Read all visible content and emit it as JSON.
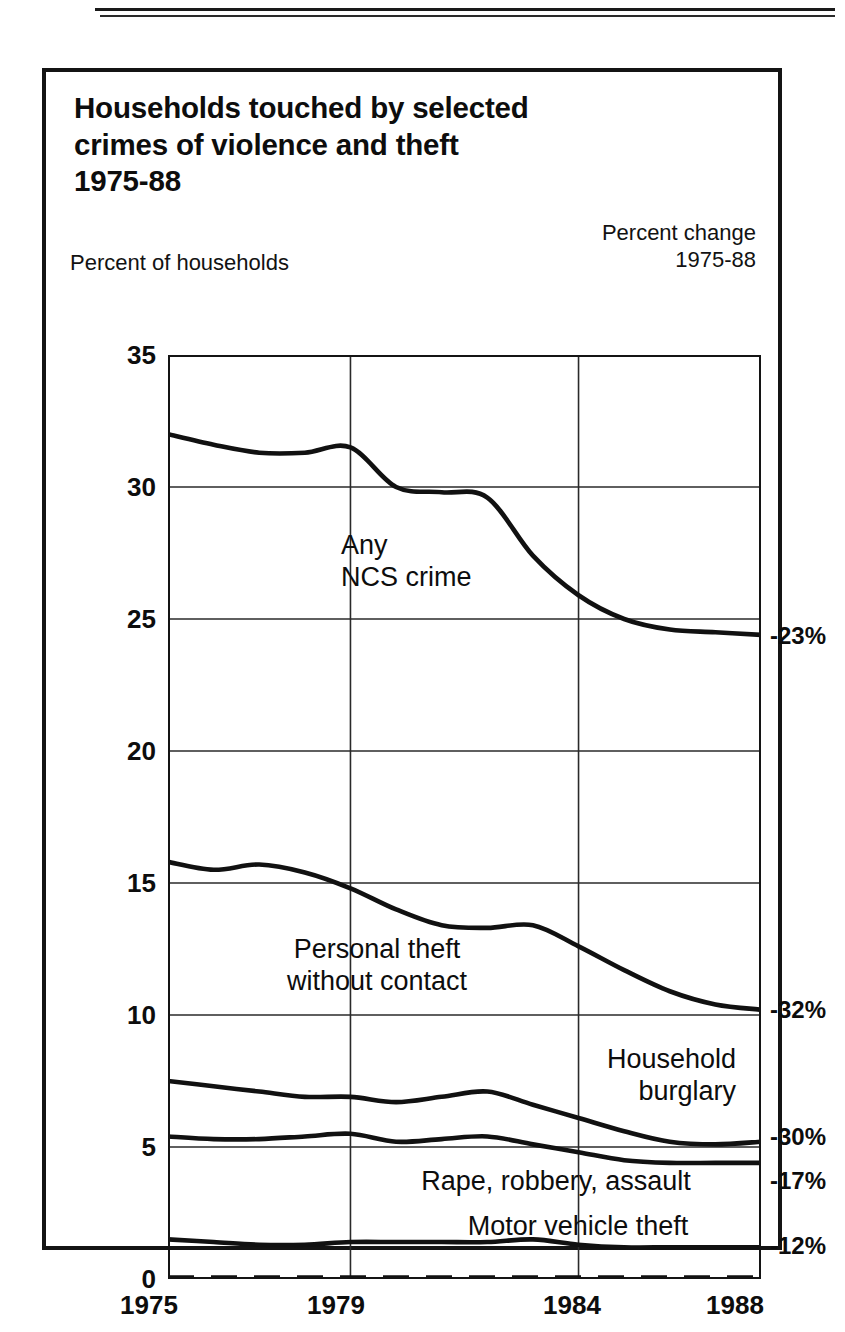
{
  "figure": {
    "title": "Households touched by selected\ncrimes of violence and theft\n1975-88",
    "y_axis_caption": "Percent of households",
    "right_caption": "Percent change\n1975-88"
  },
  "chart_data": {
    "type": "line",
    "title": "Households touched by selected crimes of violence and theft 1975-88",
    "xlabel": "",
    "ylabel": "Percent of households",
    "xlim": [
      1975,
      1988
    ],
    "ylim": [
      0,
      35
    ],
    "yticks": [
      0,
      5,
      10,
      15,
      20,
      25,
      30,
      35
    ],
    "xticks": [
      1975,
      1979,
      1984,
      1988
    ],
    "grid": true,
    "legend_position": "inline-annotations",
    "x": [
      1975,
      1976,
      1977,
      1978,
      1979,
      1980,
      1981,
      1982,
      1983,
      1984,
      1985,
      1986,
      1987,
      1988
    ],
    "series": [
      {
        "name": "Any NCS crime",
        "percent_change": "-23%",
        "values": [
          32.0,
          31.6,
          31.3,
          31.3,
          31.5,
          30.0,
          29.8,
          29.6,
          27.4,
          25.9,
          25.0,
          24.6,
          24.5,
          24.4
        ]
      },
      {
        "name": "Personal theft without contact",
        "percent_change": "-32%",
        "values": [
          15.8,
          15.5,
          15.7,
          15.4,
          14.8,
          14.0,
          13.4,
          13.3,
          13.4,
          12.6,
          11.7,
          10.9,
          10.4,
          10.2
        ]
      },
      {
        "name": "Household burglary",
        "percent_change": "-30%",
        "values": [
          7.5,
          7.3,
          7.1,
          6.9,
          6.9,
          6.7,
          6.9,
          7.1,
          6.6,
          6.1,
          5.6,
          5.2,
          5.1,
          5.2
        ]
      },
      {
        "name": "Rape, robbery, assault",
        "percent_change": "-17%",
        "values": [
          5.4,
          5.3,
          5.3,
          5.4,
          5.5,
          5.2,
          5.3,
          5.4,
          5.1,
          4.8,
          4.5,
          4.4,
          4.4,
          4.4
        ]
      },
      {
        "name": "Motor vehicle theft",
        "percent_change": "-12%",
        "values": [
          1.5,
          1.4,
          1.3,
          1.3,
          1.4,
          1.4,
          1.4,
          1.4,
          1.5,
          1.3,
          1.2,
          1.2,
          1.2,
          1.2
        ]
      }
    ]
  },
  "annotations": {
    "any_ncs_crime": "Any\nNCS crime",
    "personal_theft": "Personal theft\nwithout contact",
    "household_burglary": "Household\nburglary",
    "rape_robbery_assault": "Rape, robbery, assault",
    "motor_vehicle_theft": "Motor vehicle theft"
  },
  "axis": {
    "ytick_labels": [
      "35",
      "30",
      "25",
      "20",
      "15",
      "10",
      "5",
      "0"
    ],
    "xtick_labels": [
      "1975",
      "1979",
      "1984",
      "1988"
    ]
  },
  "percent_change_labels": {
    "any_ncs_crime": "-23%",
    "personal_theft": "-32%",
    "household_burglary": "-30%",
    "rape_robbery_assault": "-17%",
    "motor_vehicle_theft": "-12%"
  },
  "colors": {
    "ink": "#111111",
    "paper": "#ffffff",
    "grid": "#2a2a2a"
  }
}
